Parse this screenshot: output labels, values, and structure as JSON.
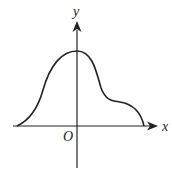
{
  "diagram": {
    "type": "function-graph",
    "axes": {
      "x_label": "x",
      "y_label": "y",
      "origin_label": "O"
    },
    "curve": {
      "description": "smooth curve starting on negative x-axis, rising to a maximum on the y-axis, descending with a shoulder, and meeting the positive x-axis",
      "color": "#222222"
    },
    "colors": {
      "axis": "#222222",
      "background": "#ffffff"
    }
  }
}
